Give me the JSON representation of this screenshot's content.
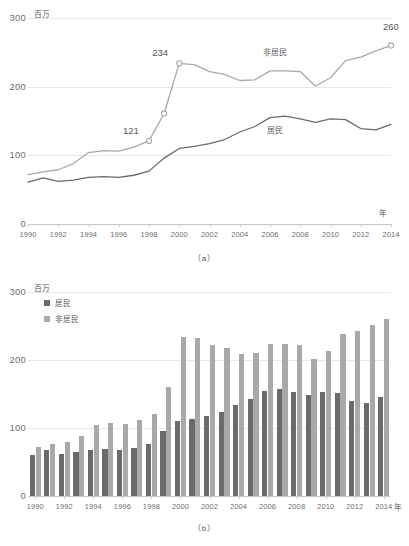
{
  "figure": {
    "unit_label": "百万",
    "x_axis_name": "年",
    "caption_a": "（a）",
    "caption_b": "（b）"
  },
  "colors": {
    "residents": "#6b6b6d",
    "nonresidents": "#a9a9ab",
    "grid": "#e8e8e8",
    "axis": "#c9c9c9",
    "text": "#58585a"
  },
  "legend": {
    "items": [
      {
        "label": "居民",
        "color": "#6b6b6d",
        "key": "residents"
      },
      {
        "label": "非居民",
        "color": "#a9a9ab",
        "key": "nonresidents"
      }
    ]
  },
  "chart_data": [
    {
      "id": "a",
      "type": "line",
      "title": "",
      "xlabel": "年",
      "ylabel": "百万",
      "ylim": [
        0,
        300
      ],
      "yticks": [
        0,
        100,
        200,
        300
      ],
      "xlim": [
        1990,
        2014
      ],
      "xticks": [
        1990,
        1992,
        1994,
        1996,
        1998,
        2000,
        2002,
        2004,
        2006,
        2008,
        2010,
        2012,
        2014
      ],
      "grid": true,
      "legend_position": "inline",
      "x": [
        1990,
        1991,
        1992,
        1993,
        1994,
        1995,
        1996,
        1997,
        1998,
        1999,
        2000,
        2001,
        2002,
        2003,
        2004,
        2005,
        2006,
        2007,
        2008,
        2009,
        2010,
        2011,
        2012,
        2013,
        2014
      ],
      "series": [
        {
          "name": "非居民",
          "color": "#a9a9ab",
          "values": [
            72,
            76,
            79,
            88,
            104,
            107,
            106,
            112,
            121,
            161,
            234,
            232,
            222,
            218,
            209,
            210,
            223,
            223,
            222,
            201,
            213,
            238,
            243,
            252,
            260
          ]
        },
        {
          "name": "居民",
          "color": "#6b6b6d",
          "values": [
            61,
            67,
            62,
            64,
            68,
            69,
            68,
            71,
            77,
            96,
            110,
            113,
            117,
            123,
            134,
            142,
            155,
            157,
            153,
            148,
            153,
            152,
            139,
            137,
            145
          ]
        }
      ],
      "annotations": [
        {
          "text": "121",
          "x": 1998,
          "y": 121,
          "series": "非居民"
        },
        {
          "text": "234",
          "x": 2000,
          "y": 234,
          "series": "非居民"
        },
        {
          "text": "260",
          "x": 2014,
          "y": 260,
          "series": "非居民"
        }
      ],
      "inline_labels": [
        {
          "text": "非居民",
          "series": "非居民"
        },
        {
          "text": "居民",
          "series": "居民"
        }
      ]
    },
    {
      "id": "b",
      "type": "bar",
      "title": "",
      "xlabel": "年",
      "ylabel": "百万",
      "ylim": [
        0,
        300
      ],
      "yticks": [
        0,
        100,
        200,
        300
      ],
      "grid": true,
      "legend_position": "top-left",
      "categories": [
        1990,
        1991,
        1992,
        1993,
        1994,
        1995,
        1996,
        1997,
        1998,
        1999,
        2000,
        2001,
        2002,
        2003,
        2004,
        2005,
        2006,
        2007,
        2008,
        2009,
        2010,
        2011,
        2012,
        2013,
        2014
      ],
      "xticks": [
        1990,
        1992,
        1994,
        1996,
        1998,
        2000,
        2002,
        2004,
        2006,
        2008,
        2010,
        2012,
        2014
      ],
      "series": [
        {
          "name": "居民",
          "color": "#6b6b6d",
          "values": [
            61,
            67,
            62,
            64,
            68,
            69,
            68,
            71,
            77,
            96,
            110,
            113,
            117,
            123,
            134,
            142,
            155,
            157,
            153,
            148,
            153,
            152,
            139,
            137,
            145
          ]
        },
        {
          "name": "非居民",
          "color": "#a9a9ab",
          "values": [
            72,
            76,
            79,
            88,
            104,
            107,
            106,
            112,
            121,
            161,
            234,
            232,
            222,
            218,
            209,
            210,
            223,
            223,
            222,
            201,
            213,
            238,
            243,
            252,
            260
          ]
        }
      ]
    }
  ]
}
